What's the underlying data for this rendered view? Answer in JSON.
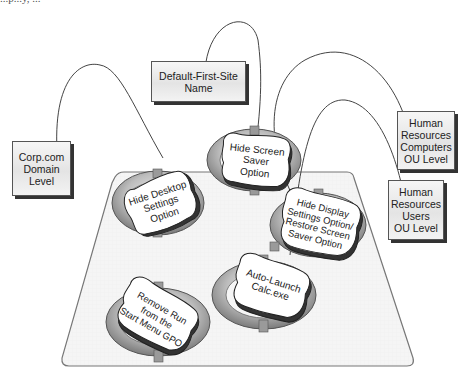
{
  "caption_fragment": "...p...y, ...",
  "platform": {
    "fill": "#f4f4f4",
    "stroke": "#777777"
  },
  "containers": [
    {
      "id": "site",
      "lines": [
        "Default-First-Site",
        "Name"
      ]
    },
    {
      "id": "domain",
      "lines": [
        "Corp.com",
        "Domain",
        "Level"
      ]
    },
    {
      "id": "hr-computers",
      "lines": [
        "Human",
        "Resources",
        "Computers",
        "OU Level"
      ]
    },
    {
      "id": "hr-users",
      "lines": [
        "Human",
        "Resources",
        "Users",
        "OU Level"
      ]
    }
  ],
  "gpos": [
    {
      "id": "hide-desktop",
      "lines": [
        "Hide Desktop",
        "Settings",
        "Option"
      ],
      "linked_to": "domain"
    },
    {
      "id": "hide-screensaver",
      "lines": [
        "Hide Screen",
        "Saver",
        "Option"
      ],
      "linked_to": "site"
    },
    {
      "id": "hide-display",
      "lines": [
        "Hide Display",
        "Settings Option/",
        "Restore Screen",
        "Saver Option"
      ],
      "linked_to": "hr-users"
    },
    {
      "id": "auto-launch",
      "lines": [
        "Auto-Launch",
        "Calc.exe"
      ],
      "linked_to": "hr-computers"
    },
    {
      "id": "remove-run",
      "lines": [
        "Remove Run",
        "from the",
        "Start Menu GPO"
      ],
      "linked_to": null
    }
  ],
  "colors": {
    "ring_dark": "#6e6e6e",
    "ring_mid": "#a9a9a9",
    "ring_light": "#d8d8d8",
    "card": "#ffffff",
    "line": "#444444"
  }
}
